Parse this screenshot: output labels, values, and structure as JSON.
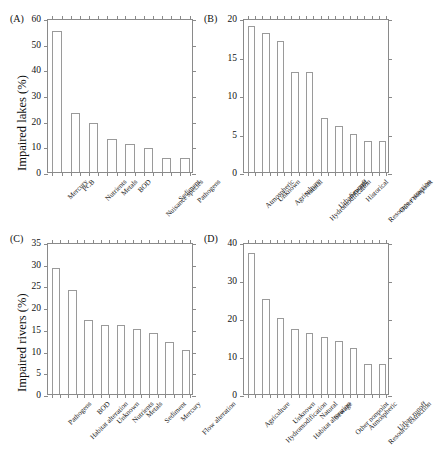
{
  "figure": {
    "background": "#ffffff",
    "axis_color": "#8a8a8a",
    "bar_edge_color": "#9a9a9a",
    "bar_fill_color": "#ffffff",
    "text_color": "#1a1a1a"
  },
  "panels": {
    "A": {
      "letter": "(A)",
      "ylabel": "Impaired lakes (%)"
    },
    "B": {
      "letter": "(B)",
      "ylabel": ""
    },
    "C": {
      "letter": "(C)",
      "ylabel": "Impaired rivers (%)"
    },
    "D": {
      "letter": "(D)",
      "ylabel": ""
    }
  },
  "chart_data": [
    {
      "panel": "A",
      "type": "bar",
      "title": "",
      "xlabel": "",
      "ylabel": "Impaired lakes (%)",
      "ylim": [
        0,
        60
      ],
      "yticks": [
        0,
        10,
        20,
        30,
        40,
        50,
        60
      ],
      "grid": false,
      "legend": "none",
      "categories": [
        "Mercury",
        "PCB",
        "Nutrients",
        "Metals",
        "BOD",
        "Nuisance species",
        "Sediment",
        "Pathogens"
      ],
      "values": [
        55,
        23,
        19,
        13,
        11,
        9.3,
        5.5,
        5.5
      ]
    },
    {
      "panel": "B",
      "type": "bar",
      "title": "",
      "xlabel": "",
      "ylabel": "",
      "ylim": [
        0,
        20
      ],
      "yticks": [
        0,
        5,
        10,
        15,
        20
      ],
      "grid": false,
      "legend": "none",
      "categories": [
        "Atmospheric",
        "Unknown",
        "Agriculture",
        "Natural",
        "Hydromodification",
        "Urban runoff",
        "Sewage",
        "Historical",
        "Resource extraction",
        "Other nonpoint"
      ],
      "values": [
        19,
        18,
        17,
        13,
        13,
        7,
        6,
        5,
        4,
        4
      ]
    },
    {
      "panel": "C",
      "type": "bar",
      "title": "",
      "xlabel": "",
      "ylabel": "Impaired rivers (%)",
      "ylim": [
        0,
        35
      ],
      "yticks": [
        0,
        5,
        10,
        15,
        20,
        25,
        30,
        35
      ],
      "grid": false,
      "legend": "none",
      "categories": [
        "Pathogens",
        "Habitat alteration",
        "BOD",
        "Unknown",
        "Nutrients",
        "Metals",
        "Sediment",
        "Mercury",
        "Flow alteration"
      ],
      "values": [
        29,
        24,
        17,
        16,
        16,
        15,
        14,
        12,
        10.2
      ]
    },
    {
      "panel": "D",
      "type": "bar",
      "title": "",
      "xlabel": "",
      "ylabel": "",
      "ylim": [
        0,
        40
      ],
      "yticks": [
        0,
        10,
        20,
        30,
        40
      ],
      "grid": false,
      "legend": "none",
      "categories": [
        "Agriculture",
        "Hydromodification",
        "Unknown",
        "Habitat alteration",
        "Natural",
        "Sewage",
        "Other nonpoint",
        "Atmospheric",
        "Resource extraction",
        "Urban runoff"
      ],
      "values": [
        37,
        25,
        20,
        17,
        16,
        15,
        14,
        12,
        8,
        8
      ]
    }
  ]
}
